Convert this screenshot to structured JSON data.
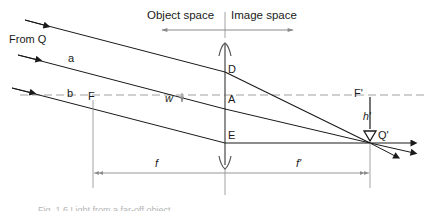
{
  "figure": {
    "header": {
      "object_space": "Object space",
      "image_space": "Image space"
    },
    "labels": {
      "from_q": "From Q",
      "ray_a": "a",
      "ray_b": "b",
      "front_focal_point": "F",
      "angle": "w",
      "point_d": "D",
      "point_a": "A",
      "point_e": "E",
      "rear_focal_point": "F'",
      "image_height": "h'",
      "image_point": "Q'",
      "front_focal_length": "f",
      "rear_focal_length": "f'"
    },
    "caption": "Fig. 1.6 Light from a far-off object",
    "colors": {
      "ray": "#1a1a1a",
      "guide": "#8a8a8a",
      "axis_dash": "#a0a0a0",
      "caption": "#b5b5b5"
    }
  }
}
